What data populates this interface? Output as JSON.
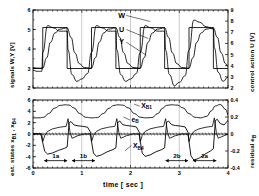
{
  "figure": {
    "xlabel": "time  [ sec ]",
    "xticks": [
      "0",
      "1",
      "2",
      "3",
      "4"
    ],
    "xlim": [
      0,
      4
    ]
  },
  "chart_data": [
    {
      "type": "line",
      "panel": "top",
      "title": "",
      "xlabel": "time [ sec ]",
      "ylabel": "signals W,Y [V]",
      "ylabel_right": "control action  U [V]",
      "xlim": [
        0,
        4
      ],
      "ylim": [
        2,
        6
      ],
      "ylim_right": [
        2,
        9
      ],
      "yticks": [
        "6",
        "5",
        "4",
        "3",
        "2"
      ],
      "yticks_right": [
        "9",
        "8",
        "7",
        "6",
        "5",
        "4",
        "3",
        "2"
      ],
      "grid": false,
      "legend_position": "inside-upper-center",
      "annotations": [
        {
          "text": "W",
          "x": 1.82,
          "y": 5.72
        },
        {
          "text": "U",
          "x": 1.82,
          "y": 5.0
        },
        {
          "text": "Y",
          "x": 1.82,
          "y": 4.35
        }
      ],
      "series": [
        {
          "name": "W",
          "description": "reference square wave",
          "x": [
            0.0,
            0.2,
            0.2,
            0.7,
            0.7,
            1.2,
            1.2,
            1.7,
            1.7,
            2.2,
            2.2,
            2.7,
            2.7,
            3.2,
            3.2,
            3.7,
            3.7,
            4.0
          ],
          "values": [
            3.0,
            3.0,
            5.1,
            5.1,
            3.0,
            3.0,
            5.1,
            5.1,
            3.0,
            3.0,
            5.1,
            5.1,
            3.0,
            3.0,
            5.1,
            5.1,
            3.0,
            3.0
          ]
        },
        {
          "name": "Y",
          "description": "plant output response",
          "x": [
            0.0,
            0.1,
            0.2,
            0.28,
            0.36,
            0.45,
            0.55,
            0.7,
            0.78,
            0.86,
            0.95,
            1.05,
            1.2,
            1.28,
            1.36,
            1.45,
            1.55,
            1.7,
            1.78,
            1.86,
            1.95,
            2.05,
            2.2,
            2.28,
            2.36,
            2.45,
            2.55,
            2.7,
            2.78,
            2.86,
            2.95,
            3.05,
            3.2,
            3.28,
            3.36,
            3.45,
            3.55,
            3.7,
            3.78,
            3.86,
            3.95,
            4.0
          ],
          "values": [
            3.05,
            3.02,
            3.02,
            3.55,
            4.35,
            4.82,
            5.02,
            5.08,
            4.6,
            3.8,
            3.25,
            3.05,
            3.02,
            3.55,
            4.35,
            4.82,
            5.02,
            5.08,
            4.6,
            3.8,
            3.25,
            3.05,
            3.02,
            3.55,
            4.35,
            4.82,
            5.02,
            5.08,
            4.6,
            3.8,
            3.25,
            3.05,
            3.02,
            3.55,
            4.35,
            4.82,
            5.02,
            5.08,
            4.6,
            3.8,
            3.25,
            3.1
          ]
        },
        {
          "name": "U",
          "description": "control action (right axis)",
          "x": [
            0.0,
            0.08,
            0.18,
            0.2,
            0.3,
            0.42,
            0.55,
            0.7,
            0.72,
            0.8,
            0.9,
            1.0,
            1.12,
            1.2,
            1.3,
            1.42,
            1.55,
            1.7,
            1.72,
            1.8,
            1.9,
            2.0,
            2.12,
            2.2,
            2.3,
            2.42,
            2.55,
            2.7,
            2.72,
            2.8,
            2.9,
            3.0,
            3.12,
            3.2,
            3.3,
            3.42,
            3.55,
            3.7,
            3.72,
            3.8,
            3.9,
            4.0
          ],
          "values_right": [
            3.6,
            3.5,
            3.5,
            5.2,
            7.6,
            7.4,
            7.1,
            7.1,
            5.4,
            3.2,
            2.6,
            2.8,
            3.3,
            5.2,
            7.6,
            7.4,
            7.1,
            7.1,
            5.4,
            3.2,
            2.6,
            2.8,
            3.3,
            5.2,
            7.6,
            7.4,
            7.1,
            7.1,
            5.4,
            3.2,
            2.2,
            2.5,
            3.1,
            5.4,
            8.1,
            7.9,
            7.5,
            7.3,
            5.6,
            3.4,
            2.6,
            3.0
          ]
        }
      ]
    },
    {
      "type": "line",
      "panel": "bottom",
      "title": "",
      "xlabel": "time  [ sec ]",
      "ylabel": "est. states  x B1 , x B4",
      "ylabel_right": "residual  e B",
      "xlim": [
        0,
        4
      ],
      "ylim": [
        -6,
        6
      ],
      "ylim_right": [
        -0.4,
        0.4
      ],
      "yticks": [
        "6",
        "4",
        "2",
        "0",
        "-2",
        "-4",
        "-6"
      ],
      "yticks_right": [
        "0.4",
        "0.2",
        "0",
        "-0.2",
        "-0.4"
      ],
      "grid": false,
      "annotations": [
        {
          "text": "X B1",
          "x": 2.22,
          "y": 5.0
        },
        {
          "text": "e B",
          "x": 2.02,
          "y": 2.55
        },
        {
          "text": "X B4",
          "x": 2.05,
          "y": -2.1
        },
        {
          "text": "1a",
          "x": 0.47,
          "y": -4.7
        },
        {
          "text": "1b",
          "x": 1.04,
          "y": -4.7
        },
        {
          "text": "2b",
          "x": 2.94,
          "y": -4.7
        },
        {
          "text": "2a",
          "x": 3.52,
          "y": -4.7
        }
      ],
      "interval_markers": [
        {
          "label": "1a",
          "start": 0.23,
          "end": 0.7
        },
        {
          "label": "1b",
          "start": 0.8,
          "end": 1.27
        },
        {
          "label": "2b",
          "start": 2.72,
          "end": 3.18
        },
        {
          "label": "2a",
          "start": 3.28,
          "end": 3.76
        }
      ],
      "series": [
        {
          "name": "x B1",
          "description": "estimated state B1, smooth rounded wave",
          "x": [
            0.0,
            0.12,
            0.22,
            0.32,
            0.44,
            0.56,
            0.66,
            0.74,
            0.84,
            0.96,
            1.08,
            1.2,
            1.32,
            1.44,
            1.56,
            1.66,
            1.74,
            1.84,
            1.96,
            2.08,
            2.2,
            2.32,
            2.44,
            2.56,
            2.66,
            2.74,
            2.84,
            2.96,
            3.08,
            3.2,
            3.32,
            3.44,
            3.56,
            3.66,
            3.74,
            3.84,
            3.96,
            4.0
          ],
          "values": [
            2.85,
            2.85,
            2.95,
            3.6,
            4.55,
            5.05,
            5.15,
            5.1,
            4.6,
            3.6,
            2.95,
            2.85,
            2.9,
            3.6,
            4.55,
            5.05,
            5.15,
            5.1,
            4.6,
            3.6,
            2.95,
            2.85,
            2.9,
            3.6,
            4.55,
            5.05,
            5.15,
            5.1,
            4.6,
            3.6,
            2.95,
            2.85,
            3.1,
            4.1,
            4.95,
            5.2,
            4.3,
            3.3
          ]
        },
        {
          "name": "e B",
          "description": "residual, right axis, near zero with spikes",
          "x": [
            0.0,
            0.18,
            0.2,
            0.24,
            0.3,
            0.4,
            0.55,
            0.68,
            0.72,
            0.76,
            0.8,
            0.92,
            1.05,
            1.18,
            1.2,
            1.24,
            1.3,
            1.4,
            1.55,
            1.68,
            1.72,
            1.76,
            1.8,
            1.92,
            2.05,
            2.18,
            2.2,
            2.24,
            2.3,
            2.4,
            2.55,
            2.68,
            2.72,
            2.76,
            2.8,
            2.92,
            3.05,
            3.18,
            3.2,
            3.24,
            3.3,
            3.4,
            3.55,
            3.68,
            3.72,
            3.76,
            3.8,
            3.92,
            4.0
          ],
          "values_right": [
            0.0,
            0.0,
            -0.09,
            -0.02,
            0.03,
            0.06,
            0.08,
            0.09,
            0.18,
            0.02,
            -0.05,
            -0.02,
            0.0,
            0.0,
            -0.09,
            -0.02,
            0.03,
            0.06,
            0.08,
            0.09,
            0.18,
            0.02,
            -0.05,
            -0.02,
            0.0,
            0.0,
            -0.09,
            -0.02,
            0.03,
            0.06,
            0.08,
            0.09,
            0.18,
            0.02,
            -0.05,
            -0.02,
            0.0,
            0.0,
            -0.09,
            -0.02,
            0.03,
            0.06,
            0.08,
            0.09,
            0.19,
            0.02,
            -0.05,
            -0.02,
            0.0
          ]
        },
        {
          "name": "x B4",
          "description": "estimated state B4, large negative excursions",
          "x": [
            0.0,
            0.16,
            0.2,
            0.24,
            0.3,
            0.4,
            0.52,
            0.64,
            0.7,
            0.74,
            0.78,
            0.84,
            0.92,
            1.02,
            1.12,
            1.18,
            1.2,
            1.24,
            1.3,
            1.4,
            1.52,
            1.64,
            1.7,
            1.74,
            1.78,
            1.84,
            1.92,
            2.02,
            2.12,
            2.18,
            2.2,
            2.24,
            2.3,
            2.4,
            2.52,
            2.64,
            2.7,
            2.74,
            2.78,
            2.84,
            2.92,
            3.02,
            3.12,
            3.18,
            3.2,
            3.24,
            3.3,
            3.4,
            3.52,
            3.64,
            3.7,
            3.74,
            3.78,
            3.84,
            3.92,
            4.0
          ],
          "values": [
            0.05,
            0.05,
            -1.55,
            -3.05,
            -3.55,
            -3.35,
            -2.9,
            -2.55,
            -2.3,
            1.95,
            2.2,
            1.6,
            1.45,
            1.35,
            1.2,
            0.3,
            -1.3,
            -3.35,
            -3.95,
            -3.7,
            -3.15,
            -2.75,
            -2.45,
            2.05,
            2.3,
            1.65,
            1.5,
            1.4,
            1.25,
            0.3,
            -1.3,
            -3.35,
            -3.95,
            -3.7,
            -3.15,
            -2.75,
            -2.45,
            2.05,
            2.3,
            1.65,
            1.5,
            1.4,
            1.25,
            0.3,
            -1.35,
            -3.85,
            -4.6,
            -4.3,
            -3.6,
            -3.0,
            -2.6,
            2.35,
            2.6,
            1.85,
            1.6,
            2.4
          ]
        }
      ]
    }
  ]
}
